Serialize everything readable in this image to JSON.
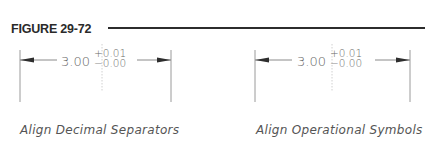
{
  "figure": {
    "title": "FIGURE 29-72"
  },
  "panels": [
    {
      "id": "decimal",
      "basic_value": "3.00",
      "upper_tolerance": "+0.01",
      "lower_tolerance": "−0.00",
      "caption": "Align Decimal Separators"
    },
    {
      "id": "operational",
      "basic_value": "3.00",
      "upper_tolerance": "+0.01",
      "lower_tolerance": "−0.00",
      "caption": "Align Operational Symbols"
    }
  ],
  "colors": {
    "heading": "#2a2a2a",
    "rule": "#2c2c2c",
    "dimension_line": "#8a8a8a",
    "arrowhead": "#2e2e2e",
    "dimension_text": "#6a6a6a",
    "caption_text": "#555555",
    "center_line": "#c8c8c8"
  }
}
